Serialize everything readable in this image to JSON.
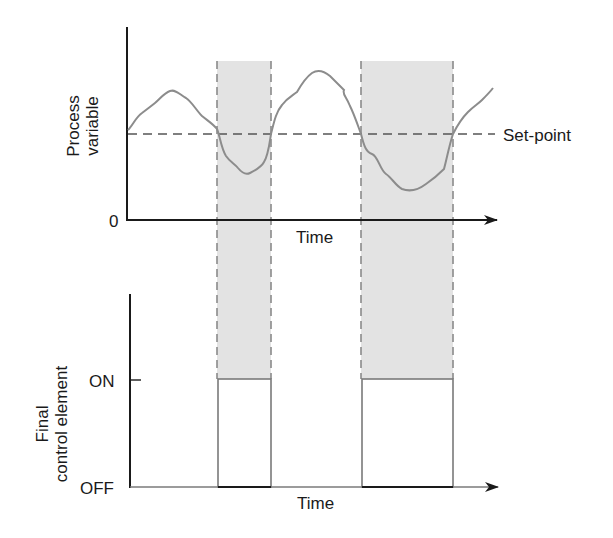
{
  "top_plot": {
    "y_axis_label_line1": "Process",
    "y_axis_label_line2": "variable",
    "origin_label": "0",
    "x_axis_label": "Time",
    "setpoint_label": "Set-point"
  },
  "bottom_plot": {
    "y_axis_label_line1": "Final",
    "y_axis_label_line2": "control element",
    "on_label": "ON",
    "off_label": "OFF",
    "x_axis_label": "Time"
  },
  "colors": {
    "axis": "#1a1a1a",
    "curve": "#8c8c8c",
    "band_fill": "#e3e3e3",
    "band_edge": "#8a8a8a",
    "setpoint": "#555555",
    "pulse": "#7a7a7a"
  },
  "on_periods": [
    {
      "x_start": 217,
      "x_end": 271
    },
    {
      "x_start": 361,
      "x_end": 453
    }
  ]
}
